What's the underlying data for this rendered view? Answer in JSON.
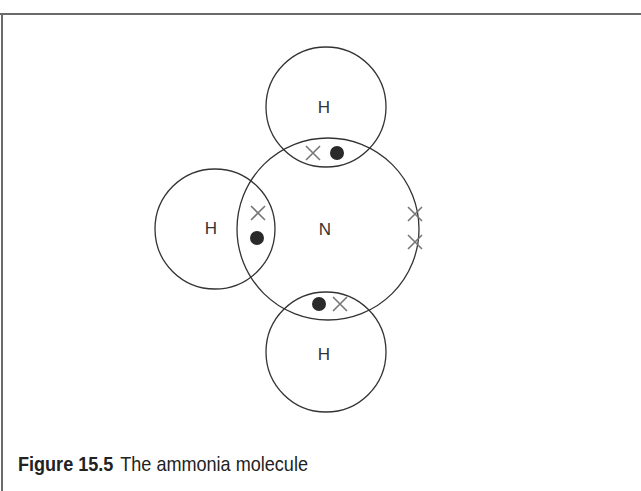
{
  "figure": {
    "number_label": "Figure 15.5",
    "title": "The ammonia molecule"
  },
  "atoms": {
    "nitrogen": {
      "label": "N",
      "cx": 328,
      "cy": 229,
      "r": 91
    },
    "hydrogen_top": {
      "label": "H",
      "cx": 326,
      "cy": 107,
      "r": 60
    },
    "hydrogen_left": {
      "label": "H",
      "cx": 215,
      "cy": 229,
      "r": 60
    },
    "hydrogen_bottom": {
      "label": "H",
      "cx": 326,
      "cy": 352,
      "r": 60
    }
  },
  "electrons": {
    "legend_note": "dots = hydrogen electrons, crosses = nitrogen electrons",
    "dots": [
      {
        "cx": 337,
        "cy": 153
      },
      {
        "cx": 257,
        "cy": 238
      },
      {
        "cx": 319,
        "cy": 304
      }
    ],
    "crosses": [
      {
        "cx": 313,
        "cy": 153
      },
      {
        "cx": 258,
        "cy": 213
      },
      {
        "cx": 340,
        "cy": 304
      },
      {
        "cx": 415,
        "cy": 214
      },
      {
        "cx": 415,
        "cy": 242
      }
    ]
  },
  "colors": {
    "line": "#333333",
    "cross": "#777777",
    "dot": "#2a2a2a",
    "frame": "#6a6a6a"
  }
}
